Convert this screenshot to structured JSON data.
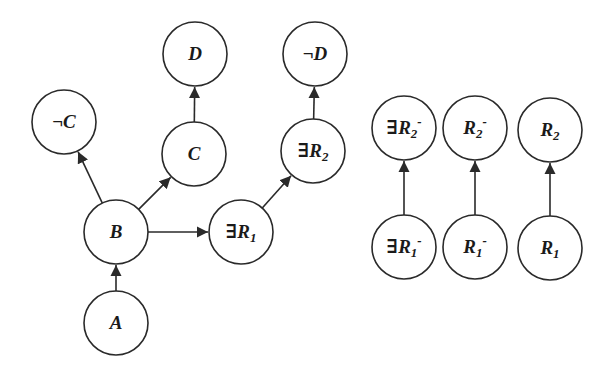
{
  "diagram": {
    "title": "",
    "colors": {
      "stroke": "#2a2a2a",
      "fill": "#ffffff",
      "text": "#1a1a1a"
    },
    "node_radius": 32,
    "nodes": [
      {
        "id": "A",
        "label": "A",
        "prefix": "",
        "sub": "",
        "sup": "",
        "x": 116,
        "y": 323
      },
      {
        "id": "B",
        "label": "B",
        "prefix": "",
        "sub": "",
        "sup": "",
        "x": 116,
        "y": 232
      },
      {
        "id": "notC",
        "label": "C",
        "prefix": "¬",
        "sub": "",
        "sup": "",
        "x": 64,
        "y": 122
      },
      {
        "id": "C",
        "label": "C",
        "prefix": "",
        "sub": "",
        "sup": "",
        "x": 194,
        "y": 154
      },
      {
        "id": "D",
        "label": "D",
        "prefix": "",
        "sub": "",
        "sup": "",
        "x": 195,
        "y": 54
      },
      {
        "id": "existsR1",
        "label": "R",
        "prefix": "∃",
        "sub": "1",
        "sup": "",
        "x": 241,
        "y": 232
      },
      {
        "id": "existsR2",
        "label": "R",
        "prefix": "∃",
        "sub": "2",
        "sup": "",
        "x": 313,
        "y": 151
      },
      {
        "id": "notD",
        "label": "D",
        "prefix": "¬",
        "sub": "",
        "sup": "",
        "x": 315,
        "y": 54
      },
      {
        "id": "existsR2inv",
        "label": "R",
        "prefix": "∃",
        "sub": "2",
        "sup": "-",
        "x": 404,
        "y": 128
      },
      {
        "id": "R2inv",
        "label": "R",
        "prefix": "",
        "sub": "2",
        "sup": "-",
        "x": 475,
        "y": 128
      },
      {
        "id": "R2",
        "label": "R",
        "prefix": "",
        "sub": "2",
        "sup": "",
        "x": 550,
        "y": 130
      },
      {
        "id": "existsR1inv",
        "label": "R",
        "prefix": "∃",
        "sub": "1",
        "sup": "-",
        "x": 404,
        "y": 247
      },
      {
        "id": "R1inv",
        "label": "R",
        "prefix": "",
        "sub": "1",
        "sup": "-",
        "x": 475,
        "y": 247
      },
      {
        "id": "R1",
        "label": "R",
        "prefix": "",
        "sub": "1",
        "sup": "",
        "x": 550,
        "y": 248
      }
    ],
    "edges": [
      {
        "from": "A",
        "to": "B"
      },
      {
        "from": "B",
        "to": "notC"
      },
      {
        "from": "B",
        "to": "C"
      },
      {
        "from": "B",
        "to": "existsR1"
      },
      {
        "from": "C",
        "to": "D"
      },
      {
        "from": "existsR1",
        "to": "existsR2"
      },
      {
        "from": "existsR2",
        "to": "notD"
      },
      {
        "from": "existsR1inv",
        "to": "existsR2inv"
      },
      {
        "from": "R1inv",
        "to": "R2inv"
      },
      {
        "from": "R1",
        "to": "R2"
      }
    ]
  }
}
